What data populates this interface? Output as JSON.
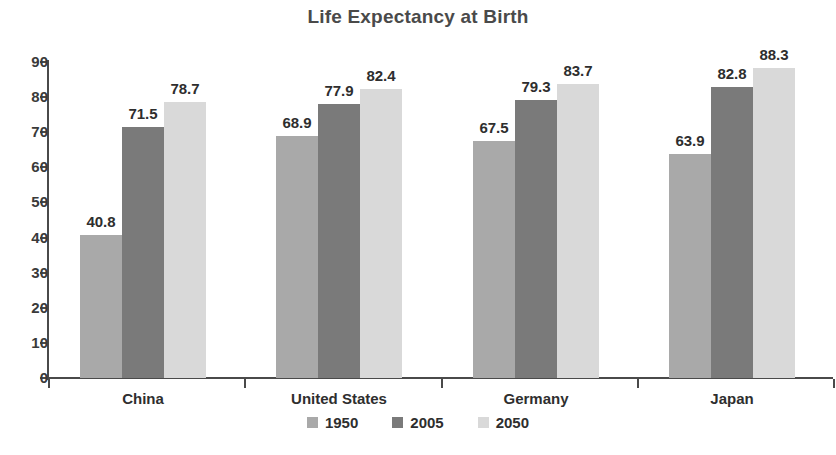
{
  "chart_data": {
    "type": "bar",
    "title": "Life Expectancy at Birth",
    "xlabel": "",
    "ylabel": "",
    "ylim": [
      0,
      90
    ],
    "yticks": [
      0,
      10,
      20,
      30,
      40,
      50,
      60,
      70,
      80,
      90
    ],
    "grid": false,
    "legend_position": "bottom",
    "categories": [
      "China",
      "United States",
      "Germany",
      "Japan"
    ],
    "series": [
      {
        "name": "1950",
        "color": "#a9a9a9",
        "values": [
          40.8,
          68.9,
          67.5,
          63.9
        ]
      },
      {
        "name": "2005",
        "color": "#7a7a7a",
        "values": [
          71.5,
          77.9,
          79.3,
          82.8
        ]
      },
      {
        "name": "2050",
        "color": "#d9d9d9",
        "values": [
          78.7,
          82.4,
          83.7,
          88.3
        ]
      }
    ],
    "data_labels": [
      [
        "40.8",
        "71.5",
        "78.7"
      ],
      [
        "68.9",
        "77.9",
        "82.4"
      ],
      [
        "67.5",
        "79.3",
        "83.7"
      ],
      [
        "63.9",
        "82.8",
        "88.3"
      ]
    ]
  },
  "axis": {
    "y_tick_labels": [
      "90",
      "80",
      "70",
      "60",
      "50",
      "40",
      "30",
      "20",
      "10",
      "0"
    ]
  },
  "legend": {
    "items": [
      {
        "label": "1950",
        "color": "#a9a9a9"
      },
      {
        "label": "2005",
        "color": "#7a7a7a"
      },
      {
        "label": "2050",
        "color": "#d9d9d9"
      }
    ]
  },
  "footer": {
    "caption": ""
  }
}
